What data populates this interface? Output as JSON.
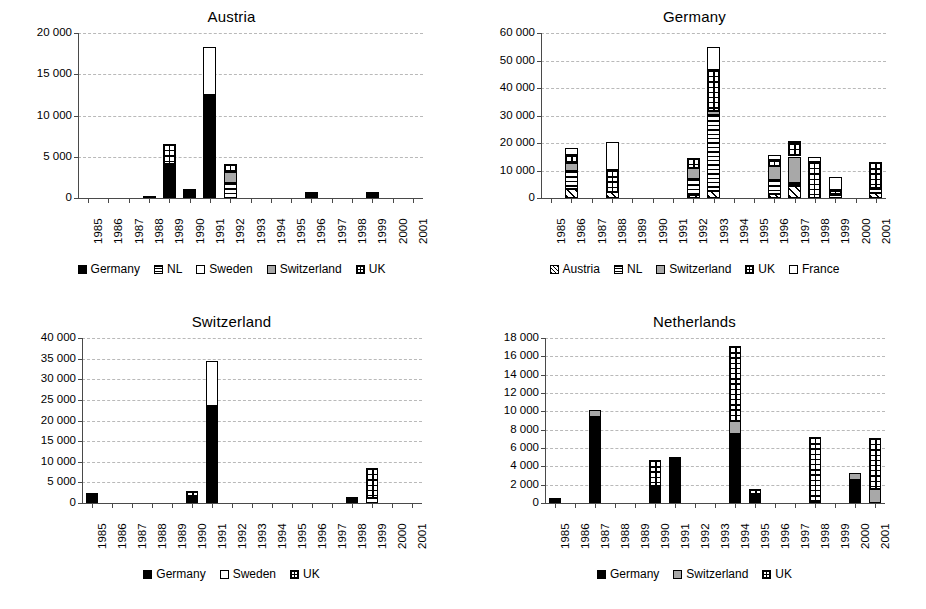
{
  "figure": {
    "panel_count": 4,
    "xlabel_years": [
      "1985",
      "1986",
      "1987",
      "1988",
      "1989",
      "1990",
      "1991",
      "1992",
      "1993",
      "1994",
      "1995",
      "1996",
      "1997",
      "1998",
      "1999",
      "2000",
      "2001"
    ]
  },
  "chart_data": [
    {
      "type": "bar",
      "stacked": true,
      "title": "Austria",
      "xlabel": "",
      "ylabel": "",
      "ylim": [
        0,
        20000
      ],
      "yticks": [
        0,
        5000,
        10000,
        15000,
        20000
      ],
      "ytick_labels": [
        "0",
        "5 000",
        "10 000",
        "15 000",
        "20 000"
      ],
      "grid": true,
      "legend_position": "bottom",
      "categories": [
        "1985",
        "1986",
        "1987",
        "1988",
        "1989",
        "1990",
        "1991",
        "1992",
        "1993",
        "1994",
        "1995",
        "1996",
        "1997",
        "1998",
        "1999",
        "2000",
        "2001"
      ],
      "series": [
        {
          "name": "Germany",
          "fill": "solid",
          "values": [
            0,
            0,
            0,
            180,
            3900,
            800,
            12450,
            0,
            0,
            0,
            0,
            450,
            0,
            0,
            430,
            0,
            0
          ]
        },
        {
          "name": "NL",
          "fill": "hstripe",
          "values": [
            0,
            0,
            0,
            0,
            250,
            0,
            0,
            1800,
            0,
            0,
            0,
            0,
            0,
            0,
            0,
            0,
            0
          ]
        },
        {
          "name": "Sweden",
          "fill": "white",
          "values": [
            0,
            0,
            0,
            0,
            0,
            0,
            5900,
            0,
            0,
            0,
            0,
            0,
            0,
            0,
            0,
            0,
            0
          ]
        },
        {
          "name": "Switzerland",
          "fill": "gray",
          "values": [
            0,
            0,
            0,
            0,
            0,
            0,
            0,
            1350,
            0,
            0,
            0,
            0,
            0,
            0,
            0,
            0,
            0
          ]
        },
        {
          "name": "UK",
          "fill": "grid",
          "values": [
            0,
            0,
            0,
            0,
            2400,
            200,
            0,
            950,
            0,
            0,
            0,
            120,
            0,
            0,
            230,
            0,
            0
          ]
        }
      ],
      "legend": [
        {
          "label": "Germany",
          "fill": "solid"
        },
        {
          "label": "NL",
          "fill": "hstripe"
        },
        {
          "label": "Sweden",
          "fill": "white"
        },
        {
          "label": "Switzerland",
          "fill": "gray"
        },
        {
          "label": "UK",
          "fill": "grid"
        }
      ]
    },
    {
      "type": "bar",
      "stacked": true,
      "title": "Germany",
      "xlabel": "",
      "ylabel": "",
      "ylim": [
        0,
        60000
      ],
      "yticks": [
        0,
        10000,
        20000,
        30000,
        40000,
        50000,
        60000
      ],
      "ytick_labels": [
        "0",
        "10 000",
        "20 000",
        "30 000",
        "40 000",
        "50 000",
        "60 000"
      ],
      "grid": true,
      "legend_position": "bottom",
      "categories": [
        "1985",
        "1986",
        "1987",
        "1988",
        "1989",
        "1990",
        "1991",
        "1992",
        "1993",
        "1994",
        "1995",
        "1996",
        "1997",
        "1998",
        "1999",
        "2000",
        "2001"
      ],
      "series": [
        {
          "name": "Austria",
          "fill": "diag",
          "values": [
            0,
            3100,
            0,
            2200,
            0,
            0,
            0,
            1000,
            2500,
            0,
            0,
            1500,
            4300,
            0,
            0,
            0,
            1700
          ]
        },
        {
          "name": "NL",
          "fill": "hstripe",
          "values": [
            0,
            6700,
            0,
            0,
            0,
            0,
            0,
            5800,
            27800,
            0,
            0,
            5200,
            1000,
            0,
            1400,
            0,
            2100
          ]
        },
        {
          "name": "Switzerland",
          "fill": "gray",
          "values": [
            0,
            3100,
            0,
            0,
            0,
            0,
            0,
            4000,
            1200,
            0,
            0,
            5000,
            9800,
            0,
            0,
            0,
            0
          ]
        },
        {
          "name": "UK",
          "fill": "grid",
          "values": [
            0,
            2900,
            0,
            7900,
            0,
            0,
            0,
            3800,
            15000,
            0,
            0,
            2000,
            4800,
            13200,
            1600,
            0,
            9200
          ]
        },
        {
          "name": "France",
          "fill": "white",
          "values": [
            0,
            2400,
            0,
            10100,
            0,
            0,
            0,
            0,
            8500,
            0,
            0,
            1900,
            400,
            1700,
            4800,
            0,
            0
          ]
        }
      ],
      "legend": [
        {
          "label": "Austria",
          "fill": "diag"
        },
        {
          "label": "NL",
          "fill": "hstripe"
        },
        {
          "label": "Switzerland",
          "fill": "gray"
        },
        {
          "label": "UK",
          "fill": "grid"
        },
        {
          "label": "France",
          "fill": "white"
        }
      ]
    },
    {
      "type": "bar",
      "stacked": true,
      "title": "Switzerland",
      "xlabel": "",
      "ylabel": "",
      "ylim": [
        0,
        40000
      ],
      "yticks": [
        0,
        5000,
        10000,
        15000,
        20000,
        25000,
        30000,
        35000,
        40000
      ],
      "ytick_labels": [
        "0",
        "5 000",
        "10 000",
        "15 000",
        "20 000",
        "25 000",
        "30 000",
        "35 000",
        "40 000"
      ],
      "grid": true,
      "legend_position": "bottom",
      "categories": [
        "1985",
        "1986",
        "1987",
        "1988",
        "1989",
        "1990",
        "1991",
        "1992",
        "1993",
        "1994",
        "1995",
        "1996",
        "1997",
        "1998",
        "1999",
        "2000",
        "2001"
      ],
      "series": [
        {
          "name": "Germany",
          "fill": "solid",
          "values": [
            2400,
            0,
            0,
            0,
            0,
            1700,
            23600,
            0,
            0,
            0,
            0,
            0,
            0,
            700,
            0,
            0,
            0
          ]
        },
        {
          "name": "Sweden",
          "fill": "white",
          "values": [
            0,
            0,
            0,
            0,
            0,
            0,
            10900,
            0,
            0,
            0,
            0,
            0,
            0,
            0,
            1300,
            0,
            0
          ]
        },
        {
          "name": "UK",
          "fill": "grid",
          "values": [
            0,
            0,
            0,
            0,
            0,
            1100,
            0,
            0,
            0,
            0,
            0,
            0,
            0,
            800,
            7100,
            0,
            0
          ]
        }
      ],
      "legend": [
        {
          "label": "Germany",
          "fill": "solid"
        },
        {
          "label": "Sweden",
          "fill": "white"
        },
        {
          "label": "UK",
          "fill": "grid"
        }
      ]
    },
    {
      "type": "bar",
      "stacked": true,
      "title": "Netherlands",
      "xlabel": "",
      "ylabel": "",
      "ylim": [
        0,
        18000
      ],
      "yticks": [
        0,
        2000,
        4000,
        6000,
        8000,
        10000,
        12000,
        14000,
        16000,
        18000
      ],
      "ytick_labels": [
        "0",
        "2 000",
        "4 000",
        "6 000",
        "8 000",
        "10 000",
        "12 000",
        "14 000",
        "16 000",
        "18 000"
      ],
      "grid": true,
      "legend_position": "bottom",
      "categories": [
        "1985",
        "1986",
        "1987",
        "1988",
        "1989",
        "1990",
        "1991",
        "1992",
        "1993",
        "1994",
        "1995",
        "1996",
        "1997",
        "1998",
        "1999",
        "2000",
        "2001"
      ],
      "series": [
        {
          "name": "Germany",
          "fill": "solid",
          "values": [
            550,
            0,
            9400,
            0,
            0,
            1850,
            5050,
            0,
            0,
            7500,
            950,
            0,
            0,
            0,
            0,
            2500,
            0
          ]
        },
        {
          "name": "Switzerland",
          "fill": "gray",
          "values": [
            0,
            0,
            750,
            0,
            0,
            0,
            0,
            0,
            0,
            1400,
            0,
            0,
            0,
            0,
            0,
            750,
            1500
          ]
        },
        {
          "name": "UK",
          "fill": "grid",
          "values": [
            0,
            0,
            0,
            0,
            0,
            2800,
            0,
            0,
            0,
            8200,
            550,
            0,
            0,
            7200,
            0,
            0,
            5600
          ]
        }
      ],
      "legend": [
        {
          "label": "Germany",
          "fill": "solid"
        },
        {
          "label": "Switzerland",
          "fill": "gray"
        },
        {
          "label": "UK",
          "fill": "grid"
        }
      ]
    }
  ]
}
